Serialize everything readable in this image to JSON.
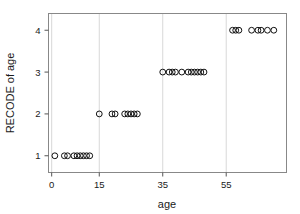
{
  "chart_data": {
    "type": "scatter",
    "title": "",
    "xlabel": "age",
    "ylabel": "RECODE of age",
    "xticks": [
      0,
      15,
      35,
      55
    ],
    "xtick_labels": [
      "0",
      "15",
      "35",
      "55"
    ],
    "yticks": [
      1,
      2,
      3,
      4
    ],
    "ytick_labels": [
      "1",
      "2",
      "3",
      "4"
    ],
    "xlim": [
      -1,
      74
    ],
    "ylim": [
      0.6,
      4.4
    ],
    "grid": "vertical-only",
    "legend": "none",
    "marker": "open-circle",
    "marker_color": "#111111",
    "points": [
      {
        "x": 1,
        "y": 1
      },
      {
        "x": 4,
        "y": 1
      },
      {
        "x": 5,
        "y": 1
      },
      {
        "x": 7,
        "y": 1
      },
      {
        "x": 8,
        "y": 1
      },
      {
        "x": 9,
        "y": 1
      },
      {
        "x": 10,
        "y": 1
      },
      {
        "x": 11,
        "y": 1
      },
      {
        "x": 12,
        "y": 1
      },
      {
        "x": 15,
        "y": 2
      },
      {
        "x": 19,
        "y": 2
      },
      {
        "x": 20,
        "y": 2
      },
      {
        "x": 23,
        "y": 2
      },
      {
        "x": 24,
        "y": 2
      },
      {
        "x": 25,
        "y": 2
      },
      {
        "x": 26,
        "y": 2
      },
      {
        "x": 27,
        "y": 2
      },
      {
        "x": 35,
        "y": 3
      },
      {
        "x": 37,
        "y": 3
      },
      {
        "x": 38,
        "y": 3
      },
      {
        "x": 39,
        "y": 3
      },
      {
        "x": 41,
        "y": 3
      },
      {
        "x": 43,
        "y": 3
      },
      {
        "x": 44,
        "y": 3
      },
      {
        "x": 45,
        "y": 3
      },
      {
        "x": 46,
        "y": 3
      },
      {
        "x": 47,
        "y": 3
      },
      {
        "x": 48,
        "y": 3
      },
      {
        "x": 57,
        "y": 4
      },
      {
        "x": 58,
        "y": 4
      },
      {
        "x": 59,
        "y": 4
      },
      {
        "x": 63,
        "y": 4
      },
      {
        "x": 65,
        "y": 4
      },
      {
        "x": 66,
        "y": 4
      },
      {
        "x": 68,
        "y": 4
      },
      {
        "x": 70,
        "y": 4
      }
    ]
  }
}
